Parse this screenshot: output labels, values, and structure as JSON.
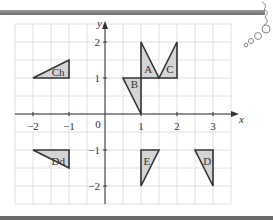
{
  "figure": {
    "x_axis_label": "x",
    "y_axis_label": "y",
    "origin_label": "0",
    "x_ticks": [
      {
        "value": -2,
        "label": "−2"
      },
      {
        "value": -1,
        "label": "−1"
      },
      {
        "value": 1,
        "label": "1"
      },
      {
        "value": 2,
        "label": "2"
      },
      {
        "value": 3,
        "label": "3"
      }
    ],
    "y_ticks": [
      {
        "value": 2,
        "label": "2"
      },
      {
        "value": 1,
        "label": "1"
      },
      {
        "value": -1,
        "label": "−1"
      },
      {
        "value": -2,
        "label": "−2"
      }
    ],
    "x_range": [
      -2.5,
      3.5
    ],
    "y_range": [
      -2.5,
      2.5
    ],
    "grid_step": 0.5,
    "shape_fill": "#d4d4d4",
    "shape_stroke": "#333333",
    "grid_color": "#d8d8d8",
    "shapes": [
      {
        "name": "A",
        "points": [
          [
            1,
            1
          ],
          [
            1,
            2
          ],
          [
            1.5,
            1
          ]
        ],
        "label_at": [
          1.2,
          1.25
        ]
      },
      {
        "name": "B",
        "points": [
          [
            0.5,
            1
          ],
          [
            1,
            1
          ],
          [
            1,
            0
          ]
        ],
        "label_at": [
          0.82,
          0.82
        ]
      },
      {
        "name": "C",
        "points": [
          [
            1.5,
            1
          ],
          [
            2,
            2
          ],
          [
            2,
            1
          ]
        ],
        "label_at": [
          1.8,
          1.25
        ]
      },
      {
        "name": "Ch",
        "points": [
          [
            -2,
            1
          ],
          [
            -1,
            1.5
          ],
          [
            -1,
            1
          ]
        ],
        "label_at": [
          -1.3,
          1.18
        ]
      },
      {
        "name": "Dd",
        "points": [
          [
            -2,
            -1
          ],
          [
            -1,
            -1
          ],
          [
            -1,
            -1.5
          ]
        ],
        "label_at": [
          -1.3,
          -1.3
        ]
      },
      {
        "name": "E",
        "points": [
          [
            1,
            -1
          ],
          [
            1.5,
            -1
          ],
          [
            1,
            -2
          ]
        ],
        "label_at": [
          1.16,
          -1.3
        ]
      },
      {
        "name": "D",
        "points": [
          [
            2.5,
            -1
          ],
          [
            3,
            -1
          ],
          [
            3,
            -2
          ]
        ],
        "label_at": [
          2.84,
          -1.3
        ]
      }
    ]
  }
}
